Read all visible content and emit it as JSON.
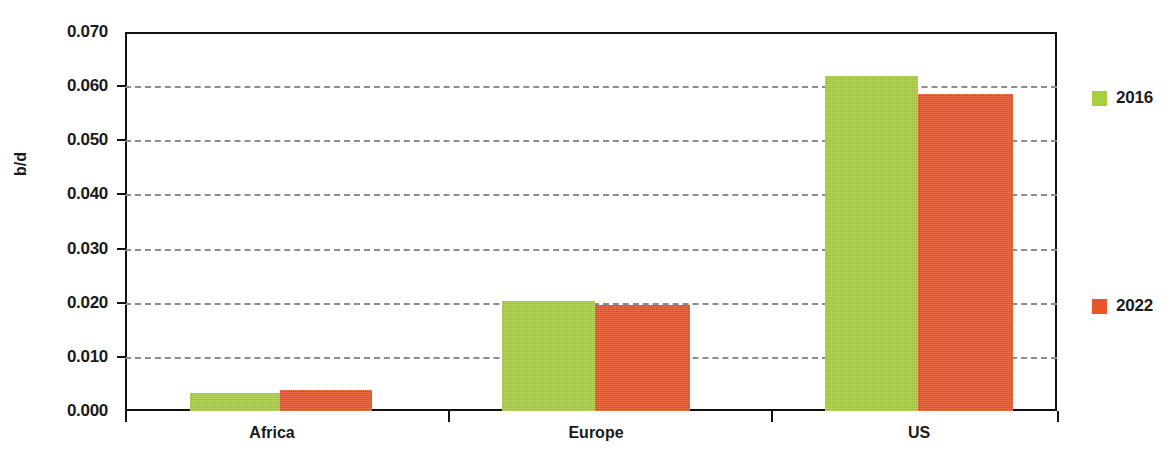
{
  "chart_data": {
    "type": "bar",
    "title": "",
    "xlabel": "",
    "ylabel": "b/d",
    "categories": [
      "Africa",
      "Europe",
      "US"
    ],
    "series": [
      {
        "name": "2016",
        "color": "#aacf3e",
        "values": [
          0.0034,
          0.0203,
          0.0618
        ]
      },
      {
        "name": "2022",
        "color": "#e8552b",
        "values": [
          0.0038,
          0.0196,
          0.0585
        ]
      }
    ],
    "ylim": [
      0.0,
      0.07
    ],
    "ytick_values": [
      0.07,
      0.06,
      0.05,
      0.04,
      0.03,
      0.02,
      0.01,
      0.0
    ],
    "ytick_labels": [
      "0.070",
      "0.060",
      "0.050",
      "0.040",
      "0.030",
      "0.020",
      "0.010",
      "0.000"
    ],
    "grid": true,
    "grid_style": "dashed",
    "grid_color": "#8d8d8d",
    "legend_position": "right",
    "legend": [
      "2016",
      "2022"
    ]
  },
  "axis": {
    "y_title": "b/d"
  },
  "legend": {
    "entries": [
      {
        "label": "2016",
        "color": "#aacf3e"
      },
      {
        "label": "2022",
        "color": "#e8552b"
      }
    ]
  },
  "colors": {
    "series_2016": "#aacf3e",
    "series_2022": "#e8552b",
    "axis": "#111111",
    "grid": "#8d8d8d",
    "text": "#1a1a1a",
    "background": "#ffffff"
  }
}
